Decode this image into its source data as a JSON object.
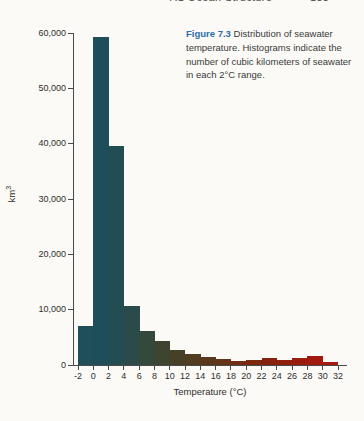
{
  "page": {
    "header_left": "7.1 Ocean Structure",
    "header_right": "183",
    "background_color": "#fbfaf6"
  },
  "caption": {
    "label": "Figure 7.3",
    "label_color": "#2d6da8",
    "text": "Distribution of seawater temperature. Histograms indicate the number of cubic kilometers of seawater in each 2°C range."
  },
  "chart_data": {
    "type": "bar",
    "title": "",
    "xlabel": "Temperature (°C)",
    "ylabel": "km³",
    "ylabel_base": "km",
    "ylabel_exp": "3",
    "bin_width_degC": 2,
    "bin_starts": [
      -2,
      0,
      2,
      4,
      6,
      8,
      10,
      12,
      14,
      16,
      18,
      20,
      22,
      24,
      26,
      28,
      30
    ],
    "values": [
      7100,
      59200,
      39500,
      10700,
      6200,
      4300,
      2700,
      2000,
      1400,
      1100,
      800,
      900,
      1200,
      900,
      1200,
      1700,
      500
    ],
    "bar_colors": [
      "#214f59",
      "#1e4e5a",
      "#224d53",
      "#2b4b4a",
      "#34483c",
      "#3d4430",
      "#464027",
      "#503c21",
      "#5a381c",
      "#653317",
      "#702d13",
      "#7c2710",
      "#87220e",
      "#911f0d",
      "#9a1c0e",
      "#a21a0f",
      "#a81910"
    ],
    "ylim": [
      0,
      60000
    ],
    "ytick_interval": 10000,
    "ytick_labels": [
      "0",
      "10,000",
      "20,000",
      "30,000",
      "40,000",
      "50,000",
      "60,000"
    ],
    "xtick_labels": [
      "-2",
      "0",
      "2",
      "4",
      "6",
      "8",
      "10",
      "12",
      "14",
      "16",
      "18",
      "20",
      "22",
      "24",
      "26",
      "28",
      "30",
      "32"
    ],
    "grid": false,
    "legend": false,
    "axis_color": "#4a4a4a"
  }
}
